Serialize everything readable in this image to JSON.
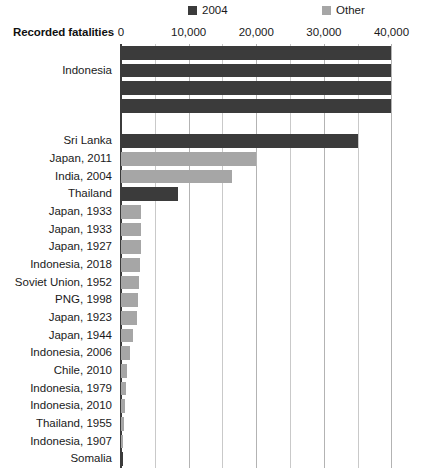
{
  "chart": {
    "type": "bar",
    "orientation": "horizontal",
    "axis_title": "Recorded fatalities",
    "legend": [
      {
        "label": "2004",
        "color": "#3b3b3b",
        "key": "2004"
      },
      {
        "label": "Other",
        "color": "#a6a6a6",
        "key": "other"
      }
    ],
    "colors": {
      "series_2004": "#3b3b3b",
      "series_other": "#a6a6a6",
      "gridline": "#c9c9c9",
      "axis": "#3b3b3b"
    },
    "xlim": [
      0,
      42000
    ],
    "xticks": [
      0,
      10000,
      20000,
      30000,
      40000
    ],
    "xtick_labels": [
      "0",
      "10,000",
      "20,000",
      "30,000",
      "40,000"
    ],
    "gridline_values": [
      0,
      5000,
      10000,
      15000,
      20000,
      25000,
      30000,
      35000,
      40000
    ],
    "grid": true,
    "legend_position": "top"
  },
  "chart_data": {
    "type": "bar",
    "title": "",
    "xlabel": "Recorded fatalities",
    "ylabel": "",
    "xlim": [
      0,
      42000
    ],
    "grid": true,
    "legend_position": "top",
    "series": [
      {
        "name": "2004",
        "color": "#3b3b3b"
      },
      {
        "name": "Other",
        "color": "#a6a6a6"
      }
    ],
    "categories": [
      "Indonesia",
      "Indonesia",
      "Indonesia",
      "Indonesia",
      "",
      "Sri Lanka",
      "Japan, 2011",
      "India, 2004",
      "Thailand",
      "Japan, 1933",
      "Japan, 1933",
      "Japan, 1927",
      "Indonesia, 2018",
      "Soviet Union, 1952",
      "PNG, 1998",
      "Japan, 1923",
      "Japan, 1944",
      "Indonesia, 2006",
      "Chile, 2010",
      "Indonesia, 1979",
      "Indonesia, 2010",
      "Thailand, 1955",
      "Indonesia, 1907",
      "Somalia"
    ],
    "values": [
      40000,
      40000,
      40000,
      40000,
      0,
      35000,
      19900,
      16400,
      8400,
      3000,
      3000,
      2900,
      2800,
      2600,
      2500,
      2400,
      1800,
      1400,
      900,
      800,
      600,
      450,
      350,
      200
    ],
    "bar_series": [
      "2004",
      "2004",
      "2004",
      "2004",
      "2004",
      "2004",
      "Other",
      "Other",
      "2004",
      "Other",
      "Other",
      "Other",
      "Other",
      "Other",
      "Other",
      "Other",
      "Other",
      "Other",
      "Other",
      "Other",
      "Other",
      "Other",
      "Other",
      "2004"
    ]
  },
  "labels": {
    "group_indonesia": "Indonesia",
    "rows": [
      {
        "text": "",
        "value": 40000,
        "series": "2004"
      },
      {
        "text": "Indonesia",
        "value": 40000,
        "series": "2004"
      },
      {
        "text": "",
        "value": 40000,
        "series": "2004"
      },
      {
        "text": "",
        "value": 40000,
        "series": "2004"
      },
      {
        "text": "",
        "value": 0,
        "series": "2004"
      },
      {
        "text": "Sri Lanka",
        "value": 35000,
        "series": "2004"
      },
      {
        "text": "Japan, 2011",
        "value": 19900,
        "series": "Other"
      },
      {
        "text": "India, 2004",
        "value": 16400,
        "series": "Other"
      },
      {
        "text": "Thailand",
        "value": 8400,
        "series": "2004"
      },
      {
        "text": "Japan, 1933",
        "value": 3000,
        "series": "Other"
      },
      {
        "text": "Japan, 1933",
        "value": 3000,
        "series": "Other"
      },
      {
        "text": "Japan, 1927",
        "value": 2900,
        "series": "Other"
      },
      {
        "text": "Indonesia, 2018",
        "value": 2800,
        "series": "Other"
      },
      {
        "text": "Soviet Union, 1952",
        "value": 2600,
        "series": "Other"
      },
      {
        "text": "PNG, 1998",
        "value": 2500,
        "series": "Other"
      },
      {
        "text": "Japan, 1923",
        "value": 2400,
        "series": "Other"
      },
      {
        "text": "Japan, 1944",
        "value": 1800,
        "series": "Other"
      },
      {
        "text": "Indonesia, 2006",
        "value": 1400,
        "series": "Other"
      },
      {
        "text": "Chile, 2010",
        "value": 900,
        "series": "Other"
      },
      {
        "text": "Indonesia, 1979",
        "value": 800,
        "series": "Other"
      },
      {
        "text": "Indonesia, 2010",
        "value": 600,
        "series": "Other"
      },
      {
        "text": "Thailand, 1955",
        "value": 450,
        "series": "Other"
      },
      {
        "text": "Indonesia, 1907",
        "value": 350,
        "series": "Other"
      },
      {
        "text": "Somalia",
        "value": 200,
        "series": "2004"
      }
    ]
  }
}
